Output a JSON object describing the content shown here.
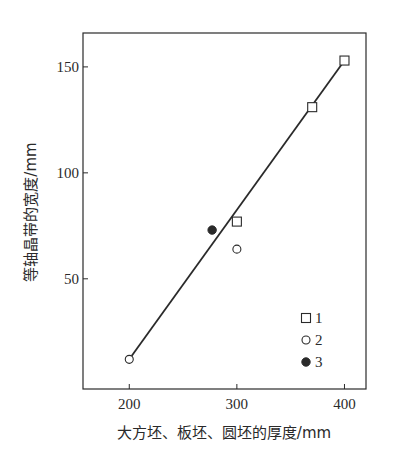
{
  "chart_data": {
    "type": "scatter",
    "title": "",
    "xlabel": "大方坯、板坯、圆坯的厚度/mm",
    "ylabel": "等轴晶带的宽度/mm",
    "xlim": [
      157,
      420
    ],
    "ylim": [
      -2,
      166
    ],
    "xticks": [
      200,
      300,
      400
    ],
    "yticks": [
      50,
      100,
      150
    ],
    "grid": false,
    "legend_position": "lower right (inside)",
    "series": [
      {
        "name": "1",
        "marker": "open-square",
        "points": [
          [
            300,
            77
          ],
          [
            370,
            131
          ],
          [
            400,
            153
          ]
        ]
      },
      {
        "name": "2",
        "marker": "open-circle",
        "points": [
          [
            200,
            12
          ],
          [
            300,
            64
          ]
        ]
      },
      {
        "name": "3",
        "marker": "filled-circle",
        "points": [
          [
            277,
            73
          ]
        ]
      }
    ],
    "fit_line": {
      "from": [
        200,
        12
      ],
      "to": [
        400,
        153
      ]
    }
  },
  "colors": {
    "ink": "#2a2a2a",
    "background": "#ffffff"
  }
}
